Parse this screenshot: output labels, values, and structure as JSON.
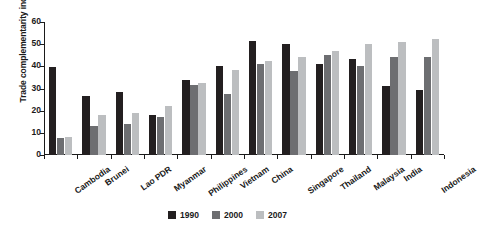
{
  "chart_data": {
    "type": "bar",
    "title": "",
    "xlabel": "",
    "ylabel": "Trade complementarity index",
    "ylim": [
      0,
      60
    ],
    "ytick_values": [
      0,
      10,
      20,
      30,
      40,
      50,
      60
    ],
    "ytick_labels": [
      "0",
      "10",
      "20",
      "30",
      "40",
      "50",
      "60"
    ],
    "grid": false,
    "legend_position": "bottom-center",
    "categories": [
      "Cambodia",
      "Brunei",
      "Lao PDR",
      "Myanmar",
      "Philippines",
      "Vietnam",
      "China",
      "Singapore",
      "Thailand",
      "Malaysia",
      "India",
      "Indonesia"
    ],
    "series": [
      {
        "name": "1990",
        "color": "#231f20",
        "values": [
          39.5,
          26.8,
          28.3,
          18.0,
          34.0,
          40.0,
          51.5,
          50.0,
          41.0,
          43.5,
          31.0,
          29.5
        ]
      },
      {
        "name": "2000",
        "color": "#6d6e71",
        "values": [
          7.5,
          13.0,
          14.0,
          17.0,
          31.5,
          27.5,
          41.0,
          38.0,
          45.0,
          40.0,
          44.0,
          44.0
        ]
      },
      {
        "name": "2007",
        "color": "#bcbec0",
        "values": [
          8.0,
          18.0,
          19.0,
          22.0,
          32.5,
          38.5,
          42.5,
          44.0,
          47.0,
          50.0,
          51.0,
          52.5
        ]
      }
    ]
  },
  "legend": {
    "items": [
      {
        "label": "1990",
        "color": "#231f20"
      },
      {
        "label": "2000",
        "color": "#6d6e71"
      },
      {
        "label": "2007",
        "color": "#bcbec0"
      }
    ]
  }
}
